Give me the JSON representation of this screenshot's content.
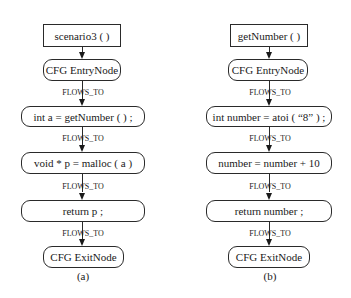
{
  "diagrams": [
    {
      "caption": "(a)",
      "title": "scenario3 ( )",
      "nodes": [
        "CFG EntryNode",
        "int a = getNumber ( ) ;",
        "void * p = malloc ( a )",
        "return p ;",
        "CFG ExitNode"
      ],
      "edge_label": "FLOWS_TO"
    },
    {
      "caption": "(b)",
      "title": "getNumber ( )",
      "nodes": [
        "CFG EntryNode",
        "int number = atoi ( “8” ) ;",
        "number = number + 10",
        "return number ;",
        "CFG ExitNode"
      ],
      "edge_label": "FLOWS_TO"
    }
  ]
}
